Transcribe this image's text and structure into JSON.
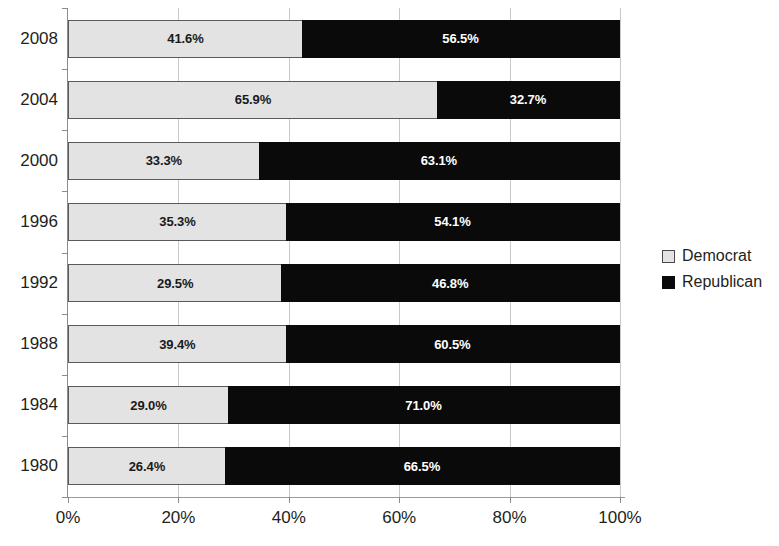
{
  "chart_data": {
    "type": "bar",
    "subtype": "stacked-horizontal-100-percent",
    "title": "",
    "subtitle": "",
    "xlabel": "",
    "ylabel": "",
    "categories": [
      "2008",
      "2004",
      "2000",
      "1996",
      "1992",
      "1988",
      "1984",
      "1980"
    ],
    "category_order": "top-to-bottom",
    "series": [
      {
        "name": "Democrat",
        "color": "#e3e3e3",
        "values": [
          41.6,
          65.9,
          33.3,
          35.3,
          29.5,
          39.4,
          29.0,
          26.4
        ],
        "labels": [
          "41.6%",
          "65.9%",
          "33.3%",
          "35.3%",
          "29.5%",
          "39.4%",
          "29.0%",
          "26.4%"
        ]
      },
      {
        "name": "Republican",
        "color": "#0a0a0a",
        "values": [
          56.5,
          32.7,
          63.1,
          54.1,
          46.8,
          60.5,
          71.0,
          66.5
        ],
        "labels": [
          "56.5%",
          "32.7%",
          "63.1%",
          "54.1%",
          "46.8%",
          "60.5%",
          "71.0%",
          "66.5%"
        ]
      }
    ],
    "xlim": [
      0,
      100
    ],
    "xticks": [
      0,
      20,
      40,
      60,
      80,
      100
    ],
    "xtick_labels": [
      "0%",
      "20%",
      "40%",
      "60%",
      "80%",
      "100%"
    ],
    "grid": "vertical",
    "legend_position": "right",
    "legend_entries": [
      "Democrat",
      "Republican"
    ]
  },
  "legend": {
    "items": [
      {
        "label": "Democrat",
        "swatch": "light-gray-square"
      },
      {
        "label": "Republican",
        "swatch": "black-square"
      }
    ]
  }
}
